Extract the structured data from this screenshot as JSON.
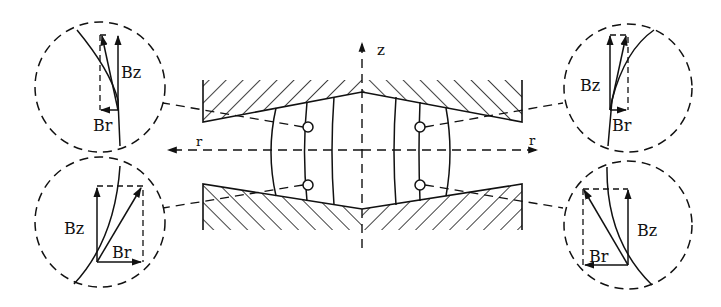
{
  "diagram": {
    "colors": {
      "stroke": "#111111",
      "background": "#ffffff"
    },
    "axes": {
      "z_label": "z",
      "r_right_label": "r",
      "r_left_label": "r"
    },
    "insets": [
      {
        "id": "top-left",
        "bz_label": "Bz",
        "br_label": "Br"
      },
      {
        "id": "bottom-left",
        "bz_label": "Bz",
        "br_label": "Br"
      },
      {
        "id": "top-right",
        "bz_label": "Bz",
        "br_label": "Br"
      },
      {
        "id": "bottom-right",
        "bz_label": "Bz",
        "br_label": "Br"
      }
    ]
  }
}
